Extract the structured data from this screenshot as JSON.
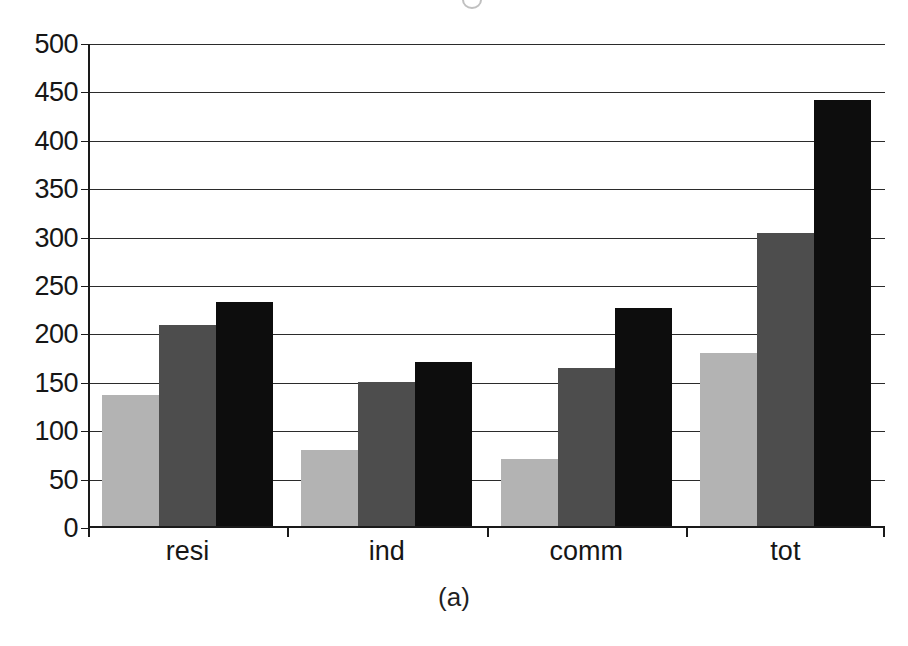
{
  "figure": {
    "caption": "(a)",
    "background_color": "#ffffff"
  },
  "chart_data": {
    "type": "bar",
    "title": "",
    "subtitle": "",
    "xlabel": "",
    "ylabel": "",
    "categories": [
      "resi",
      "ind",
      "comm",
      "tot"
    ],
    "series": [
      {
        "name": "series-1",
        "color": "#b3b3b3",
        "values": [
          137,
          81,
          71,
          181
        ]
      },
      {
        "name": "series-2",
        "color": "#4d4d4d",
        "values": [
          210,
          151,
          165,
          305
        ]
      },
      {
        "name": "series-3",
        "color": "#0d0d0d",
        "values": [
          234,
          171,
          227,
          442
        ]
      }
    ],
    "ylim": [
      0,
      500
    ],
    "ytick_values": [
      0,
      50,
      100,
      150,
      200,
      250,
      300,
      350,
      400,
      450,
      500
    ],
    "ytick_labels": [
      "0",
      "50",
      "100",
      "150",
      "200",
      "250",
      "300",
      "350",
      "400",
      "450",
      "500"
    ],
    "grid": true,
    "grid_axis": "y",
    "legend": false,
    "legend_position": "none",
    "bar_group_count": 4,
    "bars_per_group": 3
  },
  "axis": {
    "line_color": "#1a1a1a",
    "grid_color": "#2b2b2b"
  }
}
